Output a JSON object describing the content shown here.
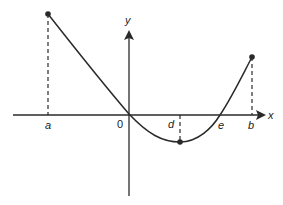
{
  "diagram": {
    "type": "function-graph",
    "colors": {
      "line": "#2a2a2a",
      "background": "#ffffff"
    },
    "axes": {
      "x_label": "x",
      "y_label": "y",
      "origin_label": "0"
    },
    "points": [
      {
        "id": "a",
        "label": "a",
        "description": "left endpoint of curve, local maximum at left boundary"
      },
      {
        "id": "origin",
        "label": "0",
        "description": "curve passes through origin"
      },
      {
        "id": "d",
        "label": "d",
        "description": "minimum of curve below x-axis"
      },
      {
        "id": "e",
        "label": "e",
        "description": "curve crosses x-axis"
      },
      {
        "id": "b",
        "label": "b",
        "description": "right endpoint of curve"
      }
    ],
    "curve": "Decreasing from (a, high) through origin to minimum at x=d, then increasing through e to (b, moderate)",
    "dashed_guides": [
      "vertical from a to endpoint",
      "vertical from d to minimum",
      "vertical from b to endpoint"
    ]
  }
}
